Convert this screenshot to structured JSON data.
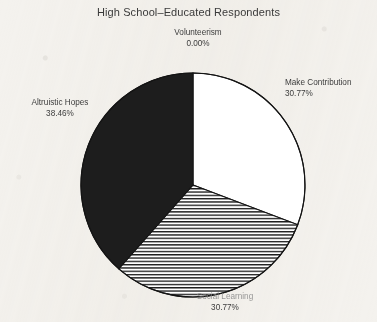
{
  "chart_data": {
    "type": "pie",
    "title": "High School–Educated Respondents",
    "xlabel": "",
    "ylabel": "",
    "legend_position": "none",
    "grid": false,
    "start_angle_deg": 0,
    "direction": "clockwise",
    "center": {
      "x": 193,
      "y": 185
    },
    "radius": 112,
    "categories": [
      "Make Contribution",
      "Social Learning",
      "Altruistic Hopes",
      "Volunteerism"
    ],
    "values": [
      30.77,
      30.77,
      38.46,
      0.0
    ],
    "value_labels": [
      "30.77%",
      "30.77%",
      "38.46%",
      "0.00%"
    ],
    "slices": [
      {
        "label": "Make Contribution",
        "value": 30.77,
        "value_label": "30.77%",
        "fill": "solid-white",
        "color": "#ffffff",
        "start_deg": 0,
        "end_deg": 110.77
      },
      {
        "label": "Social Learning",
        "value": 30.77,
        "value_label": "30.77%",
        "fill": "horizontal-hatch",
        "color": "#ffffff",
        "hatch_color": "#1b1b1b",
        "start_deg": 110.77,
        "end_deg": 221.54,
        "label_legible": false
      },
      {
        "label": "Altruistic Hopes",
        "value": 38.46,
        "value_label": "38.46%",
        "fill": "solid-black",
        "color": "#1d1d1d",
        "start_deg": 221.54,
        "end_deg": 360
      },
      {
        "label": "Volunteerism",
        "value": 0.0,
        "value_label": "0.00%",
        "fill": "none",
        "color": "#ffffff",
        "start_deg": 360,
        "end_deg": 360
      }
    ]
  },
  "labels": {
    "volunteerism": {
      "category": "Volunteerism",
      "percent": "0.00%"
    },
    "make_contribution": {
      "category": "Make Contribution",
      "percent": "30.77%"
    },
    "altruistic_hopes": {
      "category": "Altruistic Hopes",
      "percent": "38.46%"
    },
    "bottom_slice": {
      "category": "Social Learning",
      "percent": "30.77%"
    }
  },
  "style": {
    "background": "#f4f2ee",
    "outline": "#141414",
    "black_slice": "#1d1d1d",
    "white_slice": "#ffffff",
    "hatch": "#1b1b1b",
    "text": "#3a3a3a"
  }
}
